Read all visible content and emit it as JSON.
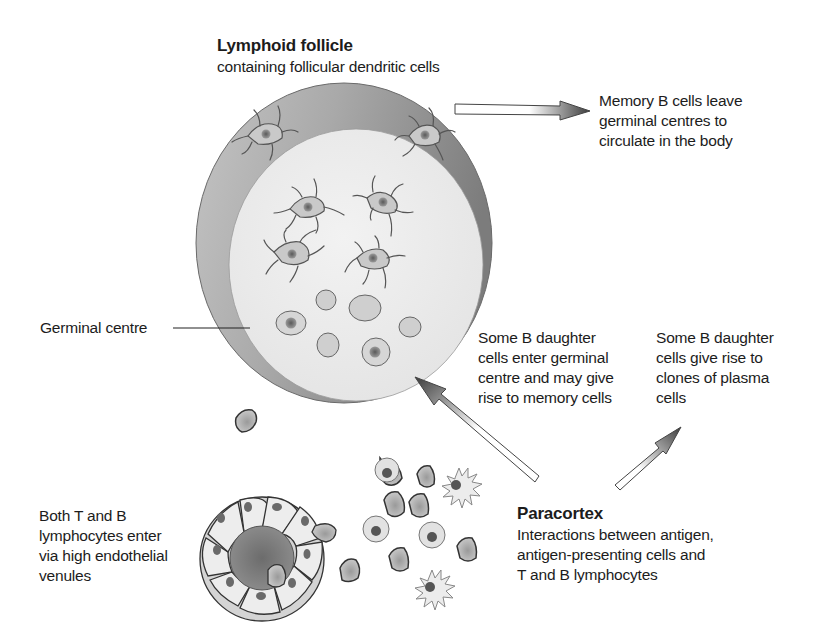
{
  "figure": {
    "type": "biology-diagram"
  },
  "labels": {
    "follicle": {
      "title": "Lymphoid follicle",
      "lines": [
        "containing follicular dendritic cells"
      ]
    },
    "memory": {
      "lines": [
        "Memory B cells leave",
        "germinal centres to",
        "circulate in the body"
      ]
    },
    "germinal_centre": {
      "text": "Germinal centre"
    },
    "daughter_memory": {
      "lines": [
        "Some B daughter",
        "cells enter germinal",
        "centre and may give",
        "rise to memory cells"
      ]
    },
    "daughter_plasma": {
      "lines": [
        "Some B daughter",
        "cells give rise to",
        "clones of plasma",
        "cells"
      ]
    },
    "venules": {
      "lines": [
        "Both T and B",
        "lymphocytes enter",
        "via high endothelial",
        "venules"
      ]
    },
    "paracortex": {
      "title": "Paracortex",
      "lines": [
        "Interactions between antigen,",
        "antigen-presenting cells and",
        "T and B lymphocytes"
      ]
    }
  },
  "colors": {
    "follicle_outer": "#8e8e8e",
    "follicle_inner": "#ececec",
    "cell_fill": "#cfcfcf",
    "nucleus": "#6f6f6f",
    "outline": "#3a3a3a",
    "text": "#1c1c1c"
  },
  "arrows": [
    {
      "name": "memory-exit-arrow",
      "direction": "right"
    },
    {
      "name": "into-germinal-centre-arrow",
      "direction": "up-left"
    },
    {
      "name": "plasma-clone-arrow",
      "direction": "up-right"
    }
  ]
}
